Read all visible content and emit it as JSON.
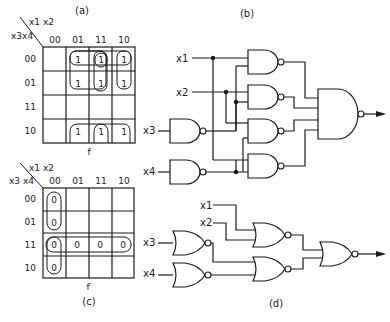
{
  "panels": {
    "a": {
      "label": "(a)",
      "col_var": "x1 x2",
      "row_var": "x3x4",
      "col_headers": [
        "00",
        "01",
        "11",
        "10"
      ],
      "row_headers": [
        "00",
        "01",
        "11",
        "10"
      ],
      "function_label": "f",
      "cells": [
        [
          "",
          "1",
          "1",
          "1"
        ],
        [
          "",
          "1",
          "1",
          "1"
        ],
        [
          "",
          "",
          "",
          ""
        ],
        [
          "",
          "1",
          "1",
          "1"
        ]
      ]
    },
    "b": {
      "label": "(b)",
      "inputs": [
        "x1",
        "x2",
        "x3",
        "x4"
      ]
    },
    "c": {
      "label": "(c)",
      "col_var": "x1 x2",
      "row_var": "x3 x4",
      "col_headers": [
        "00",
        "01",
        "11",
        "10"
      ],
      "row_headers": [
        "00",
        "01",
        "11",
        "10"
      ],
      "function_label": "f′",
      "cells": [
        [
          "0",
          "",
          "",
          ""
        ],
        [
          "0",
          "",
          "",
          ""
        ],
        [
          "0",
          "0",
          "0",
          "0"
        ],
        [
          "0",
          "",
          "",
          ""
        ]
      ]
    },
    "d": {
      "label": "(d)",
      "inputs": [
        "x1",
        "x2",
        "x3",
        "x4"
      ]
    }
  }
}
